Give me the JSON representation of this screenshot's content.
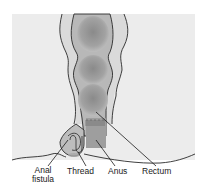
{
  "figure": {
    "colors": {
      "panel_background": "#ececec",
      "tissue_outer": "#d8d8d8",
      "rectum_lumen": "#a8a8a8",
      "rectum_dark": "#8c8c8c",
      "outline": "#2a2a2a",
      "thread": "#9a9a9a"
    }
  },
  "labels": {
    "anal_fistula_line1": "Anal",
    "anal_fistula_line2": "fistula",
    "thread": "Thread",
    "anus": "Anus",
    "rectum": "Rectum"
  }
}
